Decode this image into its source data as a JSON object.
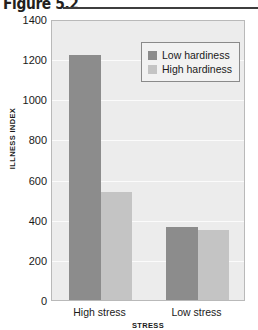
{
  "figure": {
    "title": "Figure 5.2"
  },
  "chart_data": {
    "type": "bar",
    "title": "Figure 5.2",
    "categories": [
      "High stress",
      "Low stress"
    ],
    "series": [
      {
        "name": "Low hardiness",
        "color": "#8c8c8c",
        "values": [
          1220,
          365
        ]
      },
      {
        "name": "High hardiness",
        "color": "#c4c4c4",
        "values": [
          540,
          350
        ]
      }
    ],
    "xlabel": "STRESS",
    "ylabel": "ILLNESS INDEX",
    "ylim": [
      0,
      1400
    ],
    "ytick_step": 200,
    "yticks": [
      1400,
      1200,
      1000,
      800,
      600,
      400,
      200,
      0
    ],
    "ytick_labels": [
      "1400",
      "1200",
      "1000",
      "800",
      "600",
      "400",
      "200",
      "0"
    ],
    "grid": true,
    "legend_position": "top-right",
    "plot_background": "#ececec",
    "gridline_color": "#fbfbfb"
  }
}
